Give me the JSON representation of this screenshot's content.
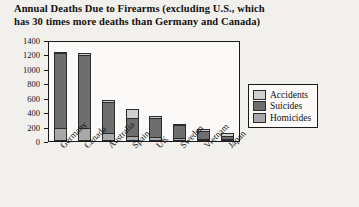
{
  "chart_data": {
    "type": "bar",
    "stacked": true,
    "title": "Annual Deaths Due to Firearms (excluding U.S., which has 30 times more deaths than Germany and Canada)",
    "title_lines": [
      "Annual Deaths Due to Firearms (excluding U.S., which",
      "has 30 times more deaths than Germany and Canada)"
    ],
    "xlabel": "",
    "ylabel": "Deaths",
    "ylim": [
      0,
      1400
    ],
    "yticks": [
      0,
      200,
      400,
      600,
      800,
      1000,
      1200,
      1400
    ],
    "grid": false,
    "legend_position": "right",
    "categories": [
      "Germany",
      "Canada",
      "Australia",
      "Spain",
      "UK",
      "Sweden",
      "Vietnam",
      "Japan"
    ],
    "series": [
      {
        "name": "Homicides",
        "color": "#a8a8a8",
        "values": [
          170,
          165,
          95,
          60,
          45,
          30,
          15,
          10
        ]
      },
      {
        "name": "Suicides",
        "color": "#6e6e6e",
        "values": [
          1030,
          1020,
          435,
          250,
          265,
          180,
          115,
          45
        ]
      },
      {
        "name": "Accidents",
        "color": "#cfcfcf",
        "values": [
          10,
          10,
          10,
          110,
          10,
          5,
          5,
          18
        ]
      }
    ],
    "totals": [
      1210,
      1195,
      540,
      420,
      320,
      215,
      135,
      73
    ]
  },
  "legend": {
    "items": [
      {
        "label": "Accidents",
        "key": "acc"
      },
      {
        "label": "Suicides",
        "key": "sui"
      },
      {
        "label": "Homicides",
        "key": "hom"
      }
    ]
  }
}
